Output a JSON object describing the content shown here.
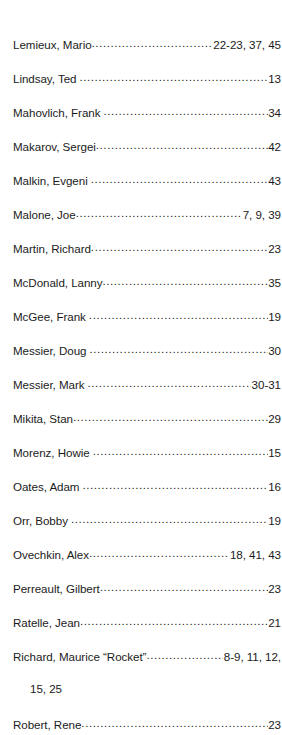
{
  "page": {
    "type": "book-index-fragment",
    "background_color": "#ffffff",
    "text_color": "#1b1b1b",
    "leader_character": "."
  },
  "entries": [
    {
      "name": "Lemieux, Mario",
      "space_before_leader": false,
      "pages": "22-23, 37, 45",
      "continuation": ""
    },
    {
      "name": "Lindsay, Ted",
      "space_before_leader": true,
      "pages": "13",
      "continuation": ""
    },
    {
      "name": "Mahovlich, Frank",
      "space_before_leader": true,
      "pages": "34",
      "continuation": ""
    },
    {
      "name": "Makarov, Sergei",
      "space_before_leader": false,
      "pages": "42",
      "continuation": ""
    },
    {
      "name": "Malkin, Evgeni",
      "space_before_leader": true,
      "pages": "43",
      "continuation": ""
    },
    {
      "name": "Malone, Joe",
      "space_before_leader": false,
      "pages": "7, 9, 39",
      "continuation": ""
    },
    {
      "name": "Martin, Richard",
      "space_before_leader": false,
      "pages": "23",
      "continuation": ""
    },
    {
      "name": "McDonald, Lanny",
      "space_before_leader": false,
      "pages": "35",
      "continuation": ""
    },
    {
      "name": "McGee, Frank",
      "space_before_leader": true,
      "pages": "19",
      "continuation": ""
    },
    {
      "name": "Messier, Doug",
      "space_before_leader": true,
      "pages": "30",
      "continuation": ""
    },
    {
      "name": "Messier, Mark",
      "space_before_leader": true,
      "pages": "30-31",
      "continuation": ""
    },
    {
      "name": "Mikita, Stan",
      "space_before_leader": false,
      "pages": "29",
      "continuation": ""
    },
    {
      "name": "Morenz, Howie",
      "space_before_leader": true,
      "pages": "15",
      "continuation": ""
    },
    {
      "name": "Oates, Adam",
      "space_before_leader": true,
      "pages": "16",
      "continuation": ""
    },
    {
      "name": "Orr, Bobby",
      "space_before_leader": true,
      "pages": "19",
      "continuation": ""
    },
    {
      "name": "Ovechkin, Alex",
      "space_before_leader": false,
      "pages": "18, 41, 43",
      "continuation": ""
    },
    {
      "name": "Perreault, Gilbert",
      "space_before_leader": false,
      "pages": "23",
      "continuation": ""
    },
    {
      "name": "Ratelle, Jean",
      "space_before_leader": false,
      "pages": "21",
      "continuation": ""
    },
    {
      "name": "Richard, Maurice “Rocket”",
      "space_before_leader": false,
      "pages": "8-9, 11, 12,",
      "continuation": "15, 25"
    },
    {
      "name": "Robert, Rene",
      "space_before_leader": false,
      "pages": "23",
      "continuation": ""
    }
  ]
}
